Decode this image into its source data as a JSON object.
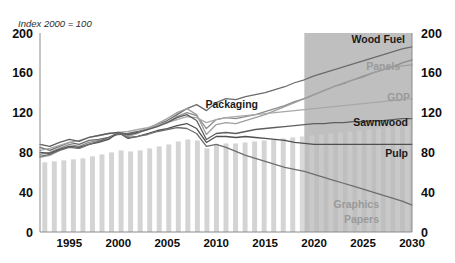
{
  "chart_data": {
    "type": "line",
    "title": "",
    "subtitle": "Index 2000 = 100",
    "xlabel": "",
    "ylabel": "",
    "xlim": [
      1992,
      2030
    ],
    "ylim": [
      0,
      200
    ],
    "yticks": [
      0,
      40,
      80,
      120,
      160,
      200
    ],
    "xticks": [
      1995,
      2000,
      2005,
      2010,
      2015,
      2020,
      2025,
      2030
    ],
    "grid": false,
    "legend_position": "inline-end-labels",
    "dual_y_axis": true,
    "forecast_start": 2019,
    "forecast_shading_color": "#bfbfbf",
    "bar_color": "#d4d4d4",
    "background_color": "#ffffff",
    "annotations": [
      "Shaded band from 2019 to 2030 marks the projection period",
      "Vertical grey bars are an unlabelled background series running 1992-2030"
    ],
    "x": [
      1992,
      1993,
      1994,
      1995,
      1996,
      1997,
      1998,
      1999,
      2000,
      2001,
      2002,
      2003,
      2004,
      2005,
      2006,
      2007,
      2008,
      2009,
      2010,
      2011,
      2012,
      2013,
      2014,
      2015,
      2016,
      2017,
      2018,
      2019,
      2020,
      2021,
      2022,
      2023,
      2024,
      2025,
      2026,
      2027,
      2028,
      2029,
      2030
    ],
    "series": [
      {
        "name": "Wood Fuel",
        "label": "Wood Fuel",
        "color": "#6b6b6b",
        "label_style": "dark",
        "end_value": 186,
        "values": [
          85,
          82,
          86,
          90,
          88,
          92,
          93,
          95,
          98,
          99,
          101,
          104,
          108,
          112,
          118,
          124,
          128,
          122,
          130,
          134,
          133,
          136,
          138,
          140,
          143,
          146,
          150,
          153,
          157,
          160,
          163,
          166,
          169,
          172,
          175,
          178,
          181,
          184,
          186
        ]
      },
      {
        "name": "Packaging",
        "label": "Packaging",
        "color": "#8c8c8c",
        "label_style": "dark",
        "end_value": 173,
        "values": [
          78,
          80,
          84,
          88,
          86,
          90,
          92,
          94,
          100,
          97,
          100,
          103,
          107,
          110,
          116,
          120,
          117,
          104,
          113,
          115,
          114,
          116,
          118,
          121,
          124,
          127,
          131,
          134,
          138,
          142,
          146,
          149,
          153,
          156,
          160,
          163,
          166,
          170,
          173
        ]
      },
      {
        "name": "Panels",
        "label": "Panels",
        "color": "#9e9e9e",
        "label_style": "grey",
        "end_value": 168,
        "values": [
          75,
          77,
          82,
          86,
          84,
          88,
          91,
          94,
          100,
          96,
          99,
          104,
          109,
          114,
          120,
          124,
          118,
          98,
          108,
          110,
          109,
          112,
          115,
          118,
          122,
          126,
          130,
          134,
          138,
          142,
          146,
          150,
          153,
          157,
          160,
          163,
          166,
          167,
          168
        ]
      },
      {
        "name": "GDP",
        "label": "GDP",
        "color": "#a8a8a8",
        "label_style": "grey",
        "end_value": 134,
        "values": [
          82,
          84,
          87,
          90,
          92,
          95,
          97,
          99,
          100,
          101,
          103,
          105,
          108,
          110,
          113,
          116,
          115,
          110,
          113,
          115,
          116,
          117,
          118,
          119,
          120,
          121,
          122,
          123,
          124,
          125,
          126,
          127,
          128,
          129,
          130,
          131,
          132,
          133,
          134
        ]
      },
      {
        "name": "Sawnwood",
        "label": "Sawnwood",
        "color": "#5e5e5e",
        "label_style": "dark",
        "end_value": 114,
        "values": [
          88,
          86,
          90,
          93,
          91,
          95,
          97,
          99,
          100,
          98,
          100,
          103,
          106,
          110,
          115,
          118,
          112,
          93,
          99,
          100,
          99,
          101,
          103,
          104,
          105,
          106,
          107,
          108,
          109,
          109,
          110,
          110,
          111,
          111,
          112,
          112,
          113,
          114,
          114
        ]
      },
      {
        "name": "Pulp",
        "label": "Pulp",
        "color": "#4f4f4f",
        "label_style": "dark",
        "end_value": 88,
        "values": [
          80,
          79,
          83,
          86,
          85,
          88,
          90,
          93,
          100,
          94,
          96,
          99,
          102,
          104,
          107,
          109,
          104,
          90,
          96,
          96,
          95,
          96,
          95,
          94,
          93,
          92,
          90,
          89,
          88,
          88,
          88,
          88,
          88,
          88,
          88,
          88,
          88,
          88,
          88
        ]
      },
      {
        "name": "Graphics Papers",
        "label": "Graphics Papers",
        "color": "#6e6e6e",
        "label_style": "grey",
        "end_value": 27,
        "values": [
          76,
          78,
          82,
          85,
          84,
          88,
          91,
          95,
          100,
          95,
          96,
          98,
          101,
          103,
          105,
          104,
          99,
          86,
          88,
          85,
          81,
          77,
          74,
          71,
          68,
          65,
          63,
          61,
          58,
          55,
          52,
          49,
          46,
          43,
          40,
          37,
          34,
          31,
          27
        ]
      }
    ],
    "bars": {
      "name": "background-bars",
      "values": [
        70,
        71,
        72,
        73,
        74,
        76,
        78,
        80,
        82,
        81,
        82,
        84,
        86,
        88,
        91,
        93,
        92,
        84,
        88,
        89,
        89,
        90,
        91,
        92,
        93,
        94,
        95,
        96,
        97,
        98,
        99,
        100,
        101,
        102,
        103,
        104,
        105,
        106,
        107
      ]
    }
  },
  "labels": {
    "index_note": "Index 2000 = 100",
    "wood_fuel": "Wood Fuel",
    "panels": "Panels",
    "gdp": "GDP",
    "packaging": "Packaging",
    "sawnwood": "Sawnwood",
    "pulp": "Pulp",
    "graphics": "Graphics",
    "papers": "Papers"
  },
  "y_axis_left": [
    "200",
    "160",
    "120",
    "80",
    "40",
    "0"
  ],
  "y_axis_right": [
    "200",
    "160",
    "120",
    "80",
    "40",
    "0"
  ],
  "x_axis": [
    "1995",
    "2000",
    "2005",
    "2010",
    "2015",
    "2020",
    "2025",
    "2030"
  ]
}
